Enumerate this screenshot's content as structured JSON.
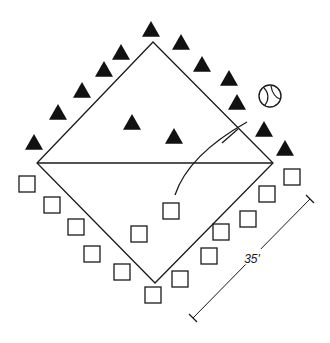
{
  "diagram": {
    "type": "field-drill-layout",
    "colors": {
      "line": "#1a1a1a",
      "fill_triangle": "#111111",
      "background": "#ffffff"
    },
    "field": {
      "shape": "diamond",
      "vertices": {
        "top": [
          153,
          42
        ],
        "left": [
          37,
          163
        ],
        "right": [
          273,
          163
        ],
        "bottom": [
          155,
          283
        ]
      },
      "midline": {
        "from": [
          37,
          163
        ],
        "to": [
          273,
          163
        ]
      }
    },
    "team_a": {
      "marker": "filled-triangle",
      "players": [
        [
          151,
          30
        ],
        [
          181,
          43
        ],
        [
          121,
          53
        ],
        [
          202,
          65
        ],
        [
          104,
          70
        ],
        [
          229,
          79
        ],
        [
          82,
          91
        ],
        [
          237,
          103
        ],
        [
          58,
          113
        ],
        [
          264,
          130
        ],
        [
          34,
          143
        ],
        [
          285,
          149
        ],
        [
          132,
          123
        ],
        [
          174,
          137
        ]
      ]
    },
    "team_b": {
      "marker": "outline-square",
      "players": [
        [
          27,
          184
        ],
        [
          52,
          205
        ],
        [
          76,
          227
        ],
        [
          92,
          254
        ],
        [
          122,
          272
        ],
        [
          153,
          295
        ],
        [
          180,
          279
        ],
        [
          209,
          256
        ],
        [
          221,
          232
        ],
        [
          248,
          219
        ],
        [
          267,
          194
        ],
        [
          292,
          177
        ],
        [
          171,
          211
        ],
        [
          139,
          234
        ]
      ]
    },
    "ball": {
      "icon": "baseball-icon",
      "center": [
        270,
        96
      ],
      "radius": 11
    },
    "throw_path": {
      "icon": "curved-arrow-path",
      "curve": "M175,195 C185,165 215,140 247,122",
      "tick": "M222,143 L238,129"
    },
    "dimension": {
      "from": [
        193,
        318
      ],
      "to": [
        310,
        199
      ],
      "label": "35'",
      "label_pos": [
        252,
        263
      ]
    }
  }
}
